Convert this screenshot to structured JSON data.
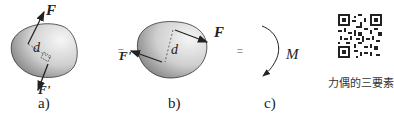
{
  "figures": [
    {
      "id": "a",
      "label": "a)",
      "force_top": "F",
      "force_bottom": "F'",
      "distance": "d"
    },
    {
      "id": "b",
      "label": "b)",
      "force_left": "F'",
      "force_right": "F",
      "distance": "d"
    },
    {
      "id": "c",
      "label": "c)",
      "moment": "M"
    }
  ],
  "equals_signs": [
    "=",
    "="
  ],
  "qr": {
    "caption": "力偶的三要素"
  }
}
